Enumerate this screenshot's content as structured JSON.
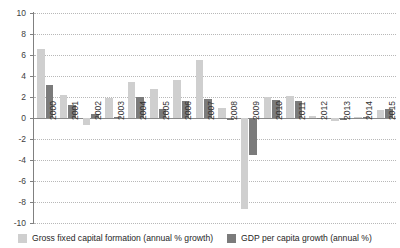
{
  "chart_data": {
    "type": "bar",
    "title": "",
    "subtitle": "",
    "xlabel": "",
    "ylabel": "",
    "ylim": [
      -10,
      10
    ],
    "ytick_step": 2,
    "grid": true,
    "legend_position": "bottom",
    "categories": [
      "2000",
      "2001",
      "2002",
      "2003",
      "2004",
      "2005",
      "2006",
      "2007",
      "2008",
      "2009",
      "2010",
      "2011",
      "2012",
      "2013",
      "2014",
      "2015"
    ],
    "yticks": [
      "10",
      "8",
      "6",
      "4",
      "2",
      "0",
      "-2",
      "-4",
      "-6",
      "-8",
      "-10"
    ],
    "ytick_values": [
      10,
      8,
      6,
      4,
      2,
      0,
      -2,
      -4,
      -6,
      -8,
      -10
    ],
    "series": [
      {
        "name": "Gross fixed capital formation (annual % growth)",
        "color": "#cfcfcf",
        "values": [
          6.6,
          2.2,
          -0.7,
          1.9,
          3.4,
          2.8,
          3.6,
          5.5,
          1.0,
          -8.7,
          2.0,
          2.1,
          0.2,
          -0.3,
          0.1,
          0.8
        ]
      },
      {
        "name": "GDP per capita growth (annual %)",
        "color": "#7b7b7b",
        "values": [
          3.1,
          1.2,
          0.4,
          0.1,
          2.0,
          0.9,
          1.6,
          1.8,
          -0.2,
          -3.5,
          1.7,
          1.6,
          -0.1,
          -0.2,
          0.1,
          0.9
        ]
      }
    ]
  },
  "legend": {
    "items": [
      {
        "label": "Gross fixed capital formation (annual % growth)",
        "color": "#cfcfcf",
        "swatch": "light"
      },
      {
        "label": "GDP per capita growth (annual %)",
        "color": "#7b7b7b",
        "swatch": "dark"
      }
    ]
  }
}
